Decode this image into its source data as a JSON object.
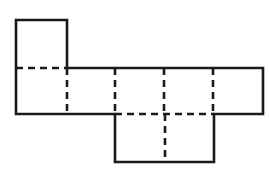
{
  "figure": {
    "kind": "geometry-net-diagram",
    "canvas": {
      "width": 269,
      "height": 179
    },
    "colors": {
      "background": "#ffffff",
      "line": "#1a1a1a",
      "face_fill": "#ffffff"
    },
    "stroke": {
      "solid_width": 2.6,
      "dashed_width": 2.6,
      "dash_pattern": "7 5"
    },
    "grid": {
      "x_columns": [
        16,
        67,
        115,
        164,
        213,
        263
      ],
      "y_rows": [
        20,
        68,
        114,
        162
      ]
    },
    "faces": [
      {
        "id": "face-top-left",
        "x": 16,
        "y": 20,
        "width": 51,
        "height": 48
      },
      {
        "id": "face-middle-1",
        "x": 16,
        "y": 68,
        "width": 51,
        "height": 46
      },
      {
        "id": "face-middle-2",
        "x": 67,
        "y": 68,
        "width": 48,
        "height": 46
      },
      {
        "id": "face-middle-3",
        "x": 115,
        "y": 68,
        "width": 49,
        "height": 46
      },
      {
        "id": "face-middle-4",
        "x": 164,
        "y": 68,
        "width": 49,
        "height": 46
      },
      {
        "id": "face-middle-5",
        "x": 213,
        "y": 68,
        "width": 50,
        "height": 46
      },
      {
        "id": "face-bottom",
        "x": 115,
        "y": 114,
        "width": 99,
        "height": 48
      }
    ],
    "outline_path": "M 16 20 L 67 20 L 67 68 L 263 68 L 263 114 L 214 114 L 214 162 L 115 162 L 115 114 L 16 114 Z",
    "fold_lines": [
      {
        "id": "fold-horizontal-left",
        "orientation": "horizontal",
        "x1": 16,
        "y1": 68,
        "x2": 67,
        "y2": 68
      },
      {
        "id": "fold-horizontal-bottom",
        "orientation": "horizontal",
        "x1": 115,
        "y1": 114,
        "x2": 214,
        "y2": 114
      },
      {
        "id": "fold-vertical-1",
        "orientation": "vertical",
        "x1": 67,
        "y1": 68,
        "x2": 67,
        "y2": 114
      },
      {
        "id": "fold-vertical-2",
        "orientation": "vertical",
        "x1": 115,
        "y1": 68,
        "x2": 115,
        "y2": 114
      },
      {
        "id": "fold-vertical-3",
        "orientation": "vertical",
        "x1": 164,
        "y1": 68,
        "x2": 164,
        "y2": 114
      },
      {
        "id": "fold-vertical-4",
        "orientation": "vertical",
        "x1": 213,
        "y1": 68,
        "x2": 213,
        "y2": 114
      },
      {
        "id": "fold-vertical-bottom",
        "orientation": "vertical",
        "x1": 165,
        "y1": 114,
        "x2": 165,
        "y2": 162
      }
    ],
    "labels": []
  }
}
